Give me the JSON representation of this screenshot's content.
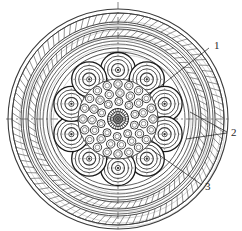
{
  "figure": {
    "kind": "technical-cross-section-diagram",
    "background_color": "#ffffff",
    "line_color": "#3a3a3a",
    "dark_line_color": "#1a1a1a",
    "centerline_color": "#555555",
    "width": 242,
    "height": 231,
    "center": {
      "x": 118,
      "y": 119
    }
  },
  "callouts": [
    {
      "id": "callout-1",
      "label": "1",
      "text_x": 214,
      "text_y": 49,
      "leaders": [
        {
          "x1": 209,
          "y1": 48,
          "x2": 158,
          "y2": 88
        }
      ]
    },
    {
      "id": "callout-2",
      "label": "2",
      "text_x": 231,
      "text_y": 136,
      "leaders": [
        {
          "x1": 227,
          "y1": 132,
          "x2": 190,
          "y2": 112
        },
        {
          "x1": 227,
          "y1": 133,
          "x2": 186,
          "y2": 139
        }
      ]
    },
    {
      "id": "callout-3",
      "label": "3",
      "text_x": 205,
      "text_y": 190,
      "leaders": [
        {
          "x1": 202,
          "y1": 185,
          "x2": 152,
          "y2": 150
        }
      ]
    }
  ],
  "centerlines": {
    "vertical": {
      "x": 118,
      "y1": 2,
      "y2": 229,
      "dash": "7 3 2 3"
    },
    "horizontal": {
      "y": 119,
      "x1": 6,
      "x2": 230,
      "dash": "7 3 2 3"
    }
  },
  "layers": [
    {
      "name": "outer-jacket-edge",
      "r": 110,
      "stroke": 1.1,
      "style": "solid"
    },
    {
      "name": "outer-jacket-inner",
      "r": 106,
      "stroke": 0.8,
      "style": "solid"
    },
    {
      "name": "outer-armour-braid",
      "r_out": 106,
      "r_in": 97,
      "style": "ladder-hatch",
      "teeth": 96
    },
    {
      "name": "bedding-ring-a",
      "r": 95,
      "stroke": 0.8,
      "style": "solid"
    },
    {
      "name": "bedding-ring-b",
      "r": 92,
      "stroke": 0.7,
      "style": "solid"
    },
    {
      "name": "inner-armour-braid",
      "r_out": 90,
      "r_in": 83,
      "style": "ladder-hatch",
      "teeth": 84
    },
    {
      "name": "tape-ring-a",
      "r": 81,
      "stroke": 0.8,
      "style": "solid"
    },
    {
      "name": "tape-ring-b",
      "r": 78,
      "stroke": 0.7,
      "style": "solid"
    },
    {
      "name": "tape-ring-c",
      "r": 75,
      "stroke": 0.7,
      "style": "solid"
    },
    {
      "name": "screen-ring",
      "r": 71,
      "stroke": 0.9,
      "style": "solid"
    },
    {
      "name": "filler-boundary",
      "r": 67,
      "stroke": 0.8,
      "style": "solid"
    },
    {
      "name": "core-binder-ring",
      "r": 49,
      "stroke": 1.4,
      "style": "scalloped"
    }
  ],
  "conductor_ring": {
    "name": "insulated-conductor-units",
    "count": 10,
    "orbit_radius": 49,
    "start_angle_deg": -90,
    "shells": [
      {
        "r": 17.5,
        "stroke": 1.3
      },
      {
        "r": 14.0,
        "stroke": 0.9
      },
      {
        "r": 10.5,
        "stroke": 0.9
      },
      {
        "r": 6.5,
        "stroke": 1.1
      },
      {
        "r": 2.6,
        "stroke": 0.9
      }
    ]
  },
  "central_bundle": {
    "name": "stranded-core-bundle",
    "outer_radius": 40,
    "core_dark_radius": 11,
    "strand_rings": [
      {
        "ring_radius": 35.0,
        "count": 20,
        "strand_r": 4.2
      },
      {
        "ring_radius": 26.0,
        "count": 15,
        "strand_r": 4.2
      },
      {
        "ring_radius": 17.5,
        "count": 10,
        "strand_r": 4.0
      }
    ],
    "core_rings": [
      {
        "r": 10.5,
        "stroke": 1.0
      },
      {
        "r": 7.5,
        "stroke": 0.8
      },
      {
        "r": 4.5,
        "stroke": 0.8
      },
      {
        "r": 2.0,
        "stroke": 0.8
      }
    ],
    "core_radial_spokes": 24
  },
  "sheen_arcs": {
    "name": "shading-arcs",
    "description": "faint offset arcs giving drawn-by-hand shading on outer jacket",
    "radii": [
      103,
      99,
      94,
      88,
      84,
      79,
      73,
      69
    ],
    "offset_x": 4,
    "offset_y": 5
  }
}
